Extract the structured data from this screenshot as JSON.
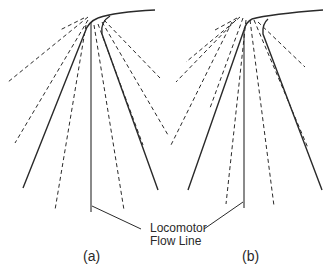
{
  "diagram": {
    "type": "flow-field-diagram",
    "callout": {
      "line1": "Locomotor",
      "line2": "Flow Line"
    },
    "panels": [
      {
        "id": "a",
        "label": "(a)"
      },
      {
        "id": "b",
        "label": "(b)"
      }
    ],
    "colors": {
      "ink": "#2a2a2a",
      "background": "#ffffff"
    }
  }
}
